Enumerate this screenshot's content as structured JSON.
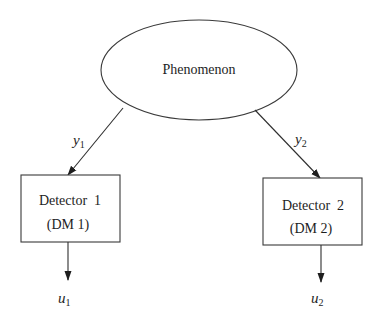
{
  "diagram": {
    "type": "block-diagram",
    "nodes": {
      "phenomenon": {
        "label": "Phenomenon",
        "shape": "ellipse"
      },
      "detector1": {
        "line1": "Detector  1",
        "line2": "(DM 1)",
        "shape": "rectangle"
      },
      "detector2": {
        "line1": "Detector  2",
        "line2": "(DM 2)",
        "shape": "rectangle"
      }
    },
    "edges": {
      "y1": {
        "var": "y",
        "sub": "1",
        "from": "Phenomenon",
        "to": "Detector 1"
      },
      "y2": {
        "var": "y",
        "sub": "2",
        "from": "Phenomenon",
        "to": "Detector 2"
      },
      "u1": {
        "var": "u",
        "sub": "1",
        "from": "Detector 1",
        "to": "output"
      },
      "u2": {
        "var": "u",
        "sub": "2",
        "from": "Detector 2",
        "to": "output"
      }
    },
    "colors": {
      "stroke": "#3a3a3a",
      "text": "#1e1e1e",
      "background": "#ffffff"
    }
  }
}
